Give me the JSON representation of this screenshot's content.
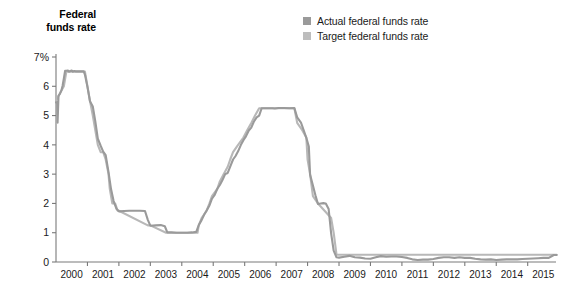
{
  "chart_data": {
    "type": "line",
    "title": "Federal funds rate",
    "xlabel": "",
    "ylabel": "Federal funds rate",
    "ylim": [
      0,
      7
    ],
    "xlim": [
      2000,
      2015.9
    ],
    "grid": false,
    "legend_position": "top-right",
    "y_ticks": [
      0,
      1,
      2,
      3,
      4,
      5,
      6,
      7
    ],
    "y_tick_labels": [
      "0",
      "1",
      "2",
      "3",
      "4",
      "5",
      "6",
      "7%"
    ],
    "x_ticks": [
      2000,
      2001,
      2002,
      2003,
      2004,
      2005,
      2006,
      2007,
      2008,
      2009,
      2010,
      2011,
      2012,
      2013,
      2014,
      2015
    ],
    "x_tick_labels": [
      "2000",
      "2001",
      "2002",
      "2003",
      "2004",
      "2005",
      "2006",
      "2007",
      "2008",
      "2009",
      "2010",
      "2011",
      "2012",
      "2013",
      "2014",
      "2015"
    ],
    "series": [
      {
        "name": "Actual federal funds rate",
        "color": "#9a9a9a",
        "points": [
          [
            2000.0,
            5.45
          ],
          [
            2000.04,
            5.45
          ],
          [
            2000.05,
            4.76
          ],
          [
            2000.08,
            5.68
          ],
          [
            2000.12,
            5.73
          ],
          [
            2000.17,
            5.85
          ],
          [
            2000.21,
            6.02
          ],
          [
            2000.25,
            6.27
          ],
          [
            2000.29,
            6.53
          ],
          [
            2000.33,
            6.53
          ],
          [
            2000.38,
            6.54
          ],
          [
            2000.42,
            6.5
          ],
          [
            2000.46,
            6.52
          ],
          [
            2000.5,
            6.54
          ],
          [
            2000.54,
            6.5
          ],
          [
            2000.58,
            6.52
          ],
          [
            2000.63,
            6.51
          ],
          [
            2000.67,
            6.51
          ],
          [
            2000.71,
            6.51
          ],
          [
            2000.75,
            6.51
          ],
          [
            2000.79,
            6.51
          ],
          [
            2000.83,
            6.51
          ],
          [
            2000.88,
            6.51
          ],
          [
            2000.92,
            6.4
          ],
          [
            2001.0,
            5.98
          ],
          [
            2001.08,
            5.49
          ],
          [
            2001.17,
            5.31
          ],
          [
            2001.25,
            4.8
          ],
          [
            2001.33,
            4.21
          ],
          [
            2001.42,
            3.97
          ],
          [
            2001.5,
            3.77
          ],
          [
            2001.58,
            3.65
          ],
          [
            2001.67,
            3.07
          ],
          [
            2001.75,
            2.49
          ],
          [
            2001.83,
            2.09
          ],
          [
            2001.92,
            1.82
          ],
          [
            2002.0,
            1.73
          ],
          [
            2002.17,
            1.74
          ],
          [
            2002.33,
            1.75
          ],
          [
            2002.5,
            1.75
          ],
          [
            2002.67,
            1.75
          ],
          [
            2002.83,
            1.74
          ],
          [
            2002.92,
            1.44
          ],
          [
            2003.0,
            1.24
          ],
          [
            2003.17,
            1.25
          ],
          [
            2003.33,
            1.26
          ],
          [
            2003.46,
            1.22
          ],
          [
            2003.54,
            1.01
          ],
          [
            2003.67,
            1.01
          ],
          [
            2003.83,
            1.0
          ],
          [
            2004.0,
            1.0
          ],
          [
            2004.17,
            1.0
          ],
          [
            2004.33,
            1.01
          ],
          [
            2004.46,
            1.03
          ],
          [
            2004.54,
            1.26
          ],
          [
            2004.63,
            1.43
          ],
          [
            2004.71,
            1.61
          ],
          [
            2004.79,
            1.76
          ],
          [
            2004.88,
            1.93
          ],
          [
            2004.96,
            2.16
          ],
          [
            2005.04,
            2.28
          ],
          [
            2005.13,
            2.5
          ],
          [
            2005.21,
            2.63
          ],
          [
            2005.29,
            2.79
          ],
          [
            2005.38,
            3.0
          ],
          [
            2005.46,
            3.04
          ],
          [
            2005.54,
            3.26
          ],
          [
            2005.63,
            3.5
          ],
          [
            2005.71,
            3.62
          ],
          [
            2005.79,
            3.78
          ],
          [
            2005.88,
            4.0
          ],
          [
            2005.96,
            4.16
          ],
          [
            2006.04,
            4.29
          ],
          [
            2006.13,
            4.49
          ],
          [
            2006.21,
            4.59
          ],
          [
            2006.29,
            4.79
          ],
          [
            2006.38,
            4.94
          ],
          [
            2006.46,
            5.0
          ],
          [
            2006.54,
            5.25
          ],
          [
            2006.63,
            5.25
          ],
          [
            2006.71,
            5.25
          ],
          [
            2006.79,
            5.25
          ],
          [
            2006.88,
            5.25
          ],
          [
            2006.96,
            5.24
          ],
          [
            2007.08,
            5.26
          ],
          [
            2007.25,
            5.26
          ],
          [
            2007.42,
            5.25
          ],
          [
            2007.58,
            5.26
          ],
          [
            2007.67,
            4.94
          ],
          [
            2007.79,
            4.76
          ],
          [
            2007.88,
            4.49
          ],
          [
            2007.96,
            4.24
          ],
          [
            2008.04,
            3.94
          ],
          [
            2008.08,
            2.98
          ],
          [
            2008.17,
            2.61
          ],
          [
            2008.25,
            2.28
          ],
          [
            2008.33,
            1.98
          ],
          [
            2008.42,
            2.0
          ],
          [
            2008.5,
            2.01
          ],
          [
            2008.58,
            2.0
          ],
          [
            2008.67,
            1.81
          ],
          [
            2008.75,
            0.97
          ],
          [
            2008.83,
            0.39
          ],
          [
            2008.92,
            0.16
          ],
          [
            2009.0,
            0.15
          ],
          [
            2009.17,
            0.18
          ],
          [
            2009.33,
            0.21
          ],
          [
            2009.5,
            0.16
          ],
          [
            2009.67,
            0.15
          ],
          [
            2009.83,
            0.12
          ],
          [
            2010.0,
            0.11
          ],
          [
            2010.17,
            0.16
          ],
          [
            2010.33,
            0.2
          ],
          [
            2010.5,
            0.18
          ],
          [
            2010.67,
            0.19
          ],
          [
            2010.83,
            0.19
          ],
          [
            2011.0,
            0.17
          ],
          [
            2011.17,
            0.14
          ],
          [
            2011.33,
            0.09
          ],
          [
            2011.5,
            0.07
          ],
          [
            2011.67,
            0.08
          ],
          [
            2011.83,
            0.08
          ],
          [
            2012.0,
            0.1
          ],
          [
            2012.17,
            0.14
          ],
          [
            2012.33,
            0.16
          ],
          [
            2012.5,
            0.16
          ],
          [
            2012.67,
            0.14
          ],
          [
            2012.83,
            0.16
          ],
          [
            2013.0,
            0.14
          ],
          [
            2013.17,
            0.14
          ],
          [
            2013.33,
            0.11
          ],
          [
            2013.5,
            0.09
          ],
          [
            2013.67,
            0.08
          ],
          [
            2013.83,
            0.09
          ],
          [
            2014.0,
            0.07
          ],
          [
            2014.17,
            0.08
          ],
          [
            2014.33,
            0.09
          ],
          [
            2014.5,
            0.09
          ],
          [
            2014.67,
            0.09
          ],
          [
            2014.83,
            0.1
          ],
          [
            2015.0,
            0.11
          ],
          [
            2015.17,
            0.12
          ],
          [
            2015.33,
            0.13
          ],
          [
            2015.5,
            0.14
          ],
          [
            2015.67,
            0.14
          ],
          [
            2015.83,
            0.24
          ],
          [
            2015.92,
            0.24
          ]
        ]
      },
      {
        "name": "Target federal funds rate",
        "color": "#b8b8b8",
        "points": [
          [
            2000.0,
            5.5
          ],
          [
            2000.12,
            5.75
          ],
          [
            2000.25,
            6.0
          ],
          [
            2000.33,
            6.5
          ],
          [
            2000.92,
            6.5
          ],
          [
            2001.0,
            6.0
          ],
          [
            2001.08,
            5.5
          ],
          [
            2001.17,
            5.0
          ],
          [
            2001.25,
            4.5
          ],
          [
            2001.33,
            4.0
          ],
          [
            2001.42,
            3.75
          ],
          [
            2001.5,
            3.75
          ],
          [
            2001.58,
            3.5
          ],
          [
            2001.67,
            3.0
          ],
          [
            2001.71,
            2.5
          ],
          [
            2001.79,
            2.0
          ],
          [
            2001.88,
            2.0
          ],
          [
            2001.96,
            1.75
          ],
          [
            2002.0,
            1.75
          ],
          [
            2002.92,
            1.25
          ],
          [
            2003.0,
            1.25
          ],
          [
            2003.5,
            1.0
          ],
          [
            2004.5,
            1.0
          ],
          [
            2004.54,
            1.25
          ],
          [
            2004.63,
            1.5
          ],
          [
            2004.79,
            1.75
          ],
          [
            2004.88,
            2.0
          ],
          [
            2004.96,
            2.25
          ],
          [
            2005.13,
            2.5
          ],
          [
            2005.21,
            2.75
          ],
          [
            2005.33,
            3.0
          ],
          [
            2005.46,
            3.25
          ],
          [
            2005.54,
            3.5
          ],
          [
            2005.63,
            3.75
          ],
          [
            2005.79,
            4.0
          ],
          [
            2005.96,
            4.25
          ],
          [
            2006.08,
            4.5
          ],
          [
            2006.21,
            4.75
          ],
          [
            2006.33,
            5.0
          ],
          [
            2006.46,
            5.25
          ],
          [
            2007.58,
            5.25
          ],
          [
            2007.67,
            4.75
          ],
          [
            2007.83,
            4.5
          ],
          [
            2007.96,
            4.25
          ],
          [
            2008.0,
            3.5
          ],
          [
            2008.08,
            3.0
          ],
          [
            2008.17,
            2.25
          ],
          [
            2008.33,
            2.0
          ],
          [
            2008.75,
            1.5
          ],
          [
            2008.83,
            1.0
          ],
          [
            2008.92,
            0.25
          ],
          [
            2015.83,
            0.25
          ],
          [
            2015.92,
            0.25
          ]
        ]
      }
    ]
  },
  "legend": {
    "items": [
      {
        "label": "Actual federal funds rate",
        "color": "#9a9a9a"
      },
      {
        "label": "Target federal funds rate",
        "color": "#bdbdbd"
      }
    ]
  },
  "axis": {
    "title_line1": "Federal",
    "title_line2": "funds rate"
  },
  "colors": {
    "actual": "#9a9a9a",
    "target": "#bdbdbd",
    "axis": "#7a7a7a",
    "text": "#1a1a1a"
  }
}
